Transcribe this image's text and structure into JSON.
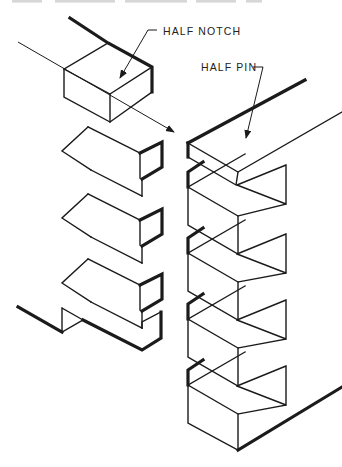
{
  "figure": {
    "type": "technical line drawing",
    "background_color": "#ffffff",
    "line_color": "#1b1b1b",
    "labels": {
      "half_notch": "HALF NOTCH",
      "half_pin": "HALF PIN"
    },
    "annotations": [
      {
        "label": "HALF NOTCH",
        "points_to": "top notch of left (tail) board"
      },
      {
        "label": "HALF PIN",
        "points_to": "top pin of right (pin) board"
      },
      {
        "name": "assembly-axis",
        "points_to": "mating corner of pin board"
      }
    ]
  }
}
